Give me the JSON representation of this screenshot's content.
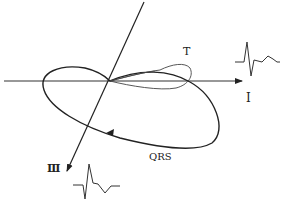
{
  "diagram": {
    "colors": {
      "line": "#222222",
      "background": "#ffffff"
    },
    "labels": {
      "t_loop": "T",
      "qrs_loop": "QRS",
      "lead_i": "I",
      "lead_iii": "Ⅲ"
    },
    "axes": [
      {
        "name": "lead-i-axis",
        "from": [
          4,
          81
        ],
        "to": [
          242,
          81
        ]
      },
      {
        "name": "lead-iii-axis",
        "from": [
          144,
          2
        ],
        "to": [
          67,
          171
        ]
      }
    ],
    "traces": [
      {
        "name": "lead-i-ecg",
        "lead": "I"
      },
      {
        "name": "lead-iii-ecg",
        "lead": "Ⅲ"
      }
    ]
  }
}
